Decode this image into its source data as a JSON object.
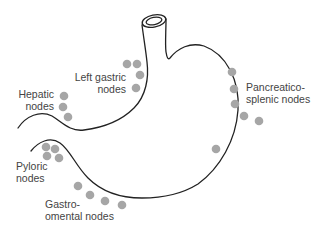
{
  "diagram": {
    "colors": {
      "outline": "#222222",
      "node": "#a6a6a6",
      "label": "#444444",
      "background": "#ffffff"
    },
    "labels": {
      "left_gastric": {
        "line1": "Left gastric",
        "line2": "nodes"
      },
      "hepatic": {
        "line1": "Hepatic",
        "line2": "nodes"
      },
      "pancreatico_splenic": {
        "line1": "Pancreatico-",
        "line2": "splenic nodes"
      },
      "pyloric": {
        "line1": "Pyloric",
        "line2": "nodes"
      },
      "gastro_omental": {
        "line1": "Gastro-",
        "line2": "omental nodes"
      }
    },
    "node_groups": [
      {
        "name": "Left gastric nodes",
        "count": 4
      },
      {
        "name": "Hepatic nodes",
        "count": 3
      },
      {
        "name": "Pancreatico-splenic nodes",
        "count": 5
      },
      {
        "name": "Unlabeled node (greater curvature)",
        "count": 1
      },
      {
        "name": "Pyloric nodes",
        "count": 4
      },
      {
        "name": "Gastro-omental nodes",
        "count": 4
      }
    ]
  }
}
